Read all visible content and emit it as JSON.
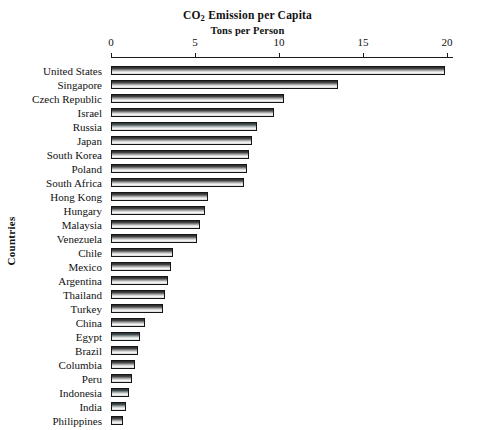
{
  "title": {
    "line1_pre": "CO",
    "line1_sub": "2",
    "line1_post": " Emission per Capita",
    "line2": "Tons per Person"
  },
  "axes": {
    "y_axis_title": "Countries",
    "x_tick_labels": [
      "0",
      "5",
      "10",
      "15",
      "20"
    ]
  },
  "chart_data": {
    "type": "bar",
    "orientation": "horizontal",
    "title": "CO2 Emission per Capita",
    "subtitle": "Tons per Person",
    "xlabel": "Tons per Person",
    "ylabel": "Countries",
    "xlim": [
      0,
      20.4
    ],
    "xticks": [
      0,
      5,
      10,
      15,
      20
    ],
    "grid": false,
    "legend": "none",
    "categories": [
      "United States",
      "Singapore",
      "Czech Republic",
      "Israel",
      "Russia",
      "Japan",
      "South Korea",
      "Poland",
      "South Africa",
      "Hong Kong",
      "Hungary",
      "Malaysia",
      "Venezuela",
      "Chile",
      "Mexico",
      "Argentina",
      "Thailand",
      "Turkey",
      "China",
      "Egypt",
      "Brazil",
      "Columbia",
      "Peru",
      "Indonesia",
      "India",
      "Philippines"
    ],
    "values": [
      19.9,
      13.5,
      10.3,
      9.7,
      8.7,
      8.4,
      8.2,
      8.1,
      7.9,
      5.8,
      5.6,
      5.3,
      5.1,
      3.7,
      3.6,
      3.4,
      3.2,
      3.1,
      2.0,
      1.7,
      1.6,
      1.4,
      1.25,
      1.05,
      0.9,
      0.7
    ]
  }
}
